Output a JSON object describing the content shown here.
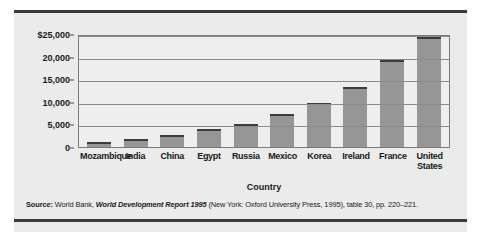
{
  "chart_data": {
    "type": "bar",
    "title": "",
    "xlabel": "Country",
    "ylabel": "1993 International dollars",
    "categories": [
      "Mozambique",
      "India",
      "China",
      "Egypt",
      "Russia",
      "Mexico",
      "Korea",
      "Ireland",
      "France",
      "United States"
    ],
    "values": [
      1000,
      1800,
      2700,
      4000,
      5200,
      7200,
      9700,
      13300,
      19200,
      24400
    ],
    "ylim": [
      0,
      25000
    ],
    "yticks": [
      0,
      5000,
      10000,
      15000,
      20000,
      25000
    ],
    "ytick_labels": [
      "0",
      "5,000",
      "10,000",
      "15,000",
      "20,000",
      "$25,000"
    ],
    "grid": true,
    "legend": "none",
    "bar_color": "#969696",
    "bar_cap_color": "#3c3c3c",
    "plot_background": "#eeeeee",
    "panel_background": "#ebebeb"
  },
  "source_note": {
    "label": "Source:",
    "publisher": " World Bank, ",
    "report_title": "World Development Report 1995",
    "details": " (New York: Oxford University Press, 1995), table 30, pp. 220–221."
  }
}
